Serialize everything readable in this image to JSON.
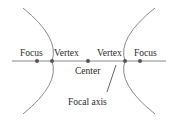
{
  "diagram": {
    "type": "hyperbola",
    "colors": {
      "curve": "#8a8a8a",
      "axis": "#8a8a8a",
      "point": "#555555",
      "text": "#2a2a2a",
      "background": "#ffffff"
    },
    "labels": {
      "left_focus": "Focus",
      "left_vertex": "Vertex",
      "right_vertex": "Vertex",
      "right_focus": "Focus",
      "center": "Center",
      "focal_axis": "Focal axis"
    }
  }
}
